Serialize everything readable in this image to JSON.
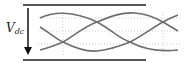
{
  "label": {
    "symbol": "V",
    "subscript": "dc"
  },
  "colors": {
    "rail": "#555555",
    "arrow": "#111111",
    "curve": "#6e6e6e",
    "grid": "#cfcfcf"
  }
}
